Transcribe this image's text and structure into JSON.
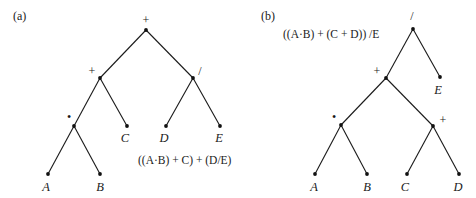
{
  "figure": {
    "panels": [
      {
        "label": "(a)",
        "expression": "((A·B) + C) + (D/E)",
        "nodes": {
          "root": {
            "symbol": "+"
          },
          "left": {
            "symbol": "+"
          },
          "right": {
            "symbol": "/"
          },
          "mul": {
            "symbol": "•"
          },
          "A": {
            "symbol": "A"
          },
          "B": {
            "symbol": "B"
          },
          "C": {
            "symbol": "C"
          },
          "D": {
            "symbol": "D"
          },
          "E": {
            "symbol": "E"
          }
        },
        "edges": [
          [
            "root",
            "left"
          ],
          [
            "root",
            "right"
          ],
          [
            "left",
            "mul"
          ],
          [
            "left",
            "C"
          ],
          [
            "right",
            "D"
          ],
          [
            "right",
            "E"
          ],
          [
            "mul",
            "A"
          ],
          [
            "mul",
            "B"
          ]
        ]
      },
      {
        "label": "(b)",
        "expression": "((A·B) + (C + D)) /E",
        "nodes": {
          "root": {
            "symbol": "/"
          },
          "plus": {
            "symbol": "+"
          },
          "E": {
            "symbol": "E"
          },
          "mul": {
            "symbol": "•"
          },
          "plus2": {
            "symbol": "+"
          },
          "A": {
            "symbol": "A"
          },
          "B": {
            "symbol": "B"
          },
          "C": {
            "symbol": "C"
          },
          "D": {
            "symbol": "D"
          }
        },
        "edges": [
          [
            "root",
            "plus"
          ],
          [
            "root",
            "E"
          ],
          [
            "plus",
            "mul"
          ],
          [
            "plus",
            "plus2"
          ],
          [
            "mul",
            "A"
          ],
          [
            "mul",
            "B"
          ],
          [
            "plus2",
            "C"
          ],
          [
            "plus2",
            "D"
          ]
        ]
      }
    ]
  }
}
